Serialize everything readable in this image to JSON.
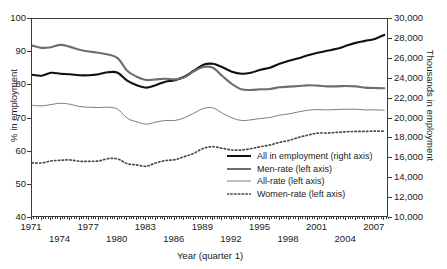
{
  "figure": {
    "caption": "",
    "axis_title_left": "% in employment",
    "axis_title_right": "Thousands in employment",
    "axis_title_x": "Year (quarter 1)"
  },
  "chart_data": {
    "type": "line",
    "title": "",
    "xlabel": "Year (quarter I)",
    "ylabel": "% in employment",
    "y2label": "Thousands in employment",
    "grid": false,
    "legend_position": "inside-bottom-right",
    "xlim": [
      1971,
      2008.5
    ],
    "ylim": [
      40,
      100
    ],
    "y2lim": [
      10000,
      30000
    ],
    "xticklabels": [
      "1971",
      "1974",
      "1977",
      "1980",
      "1983",
      "1986",
      "1989",
      "1992",
      "1995",
      "1998",
      "2001",
      "2004",
      "2007"
    ],
    "xtickvalues": [
      1971,
      1974,
      1977,
      1980,
      1983,
      1986,
      1989,
      1992,
      1995,
      1998,
      2001,
      2004,
      2007
    ],
    "yticklabels": [
      "40",
      "50",
      "60",
      "70",
      "80",
      "90",
      "100"
    ],
    "ytickvalues": [
      40,
      50,
      60,
      70,
      80,
      90,
      100
    ],
    "y2ticklabels": [
      "10,000",
      "12,000",
      "14,000",
      "16,000",
      "18,000",
      "20,000",
      "22,000",
      "24,000",
      "26,000",
      "28,000",
      "30,000"
    ],
    "y2tickvalues": [
      10000,
      12000,
      14000,
      16000,
      18000,
      20000,
      22000,
      24000,
      26000,
      28000,
      30000
    ],
    "x": [
      1971,
      1972,
      1973,
      1974,
      1975,
      1976,
      1977,
      1978,
      1979,
      1980,
      1981,
      1982,
      1983,
      1984,
      1985,
      1986,
      1987,
      1988,
      1989,
      1990,
      1991,
      1992,
      1993,
      1994,
      1995,
      1996,
      1997,
      1998,
      1999,
      2000,
      2001,
      2002,
      2003,
      2004,
      2005,
      2006,
      2007,
      2008
    ],
    "series": [
      {
        "name": "All in employment (right axis)",
        "axis": "right",
        "style": "solid-thick-black",
        "color": "#111111",
        "units": "thousands",
        "values": [
          24400,
          24300,
          24600,
          24500,
          24450,
          24350,
          24350,
          24450,
          24650,
          24600,
          23800,
          23350,
          23100,
          23350,
          23700,
          23850,
          24200,
          24800,
          25400,
          25500,
          25150,
          24700,
          24500,
          24600,
          24900,
          25100,
          25500,
          25800,
          26050,
          26350,
          26600,
          26800,
          27000,
          27300,
          27600,
          27800,
          28000,
          28400
        ]
      },
      {
        "name": "Men-rate (left axis)",
        "axis": "left",
        "style": "solid-thick-gray",
        "color": "#6e6e6e",
        "units": "percent",
        "values": [
          92.0,
          91.3,
          91.5,
          92.2,
          91.6,
          90.7,
          90.2,
          89.8,
          89.3,
          88.2,
          84.4,
          82.6,
          81.6,
          81.8,
          82.0,
          81.8,
          82.4,
          84.2,
          85.5,
          85.3,
          82.8,
          80.4,
          78.8,
          78.6,
          78.8,
          78.9,
          79.4,
          79.6,
          79.8,
          80.0,
          79.9,
          79.7,
          79.7,
          79.8,
          79.7,
          79.3,
          79.2,
          79.1
        ]
      },
      {
        "name": "All-rate (left axis)",
        "axis": "left",
        "style": "solid-thin-gray",
        "color": "#6e6e6e",
        "units": "percent",
        "values": [
          74.0,
          73.8,
          74.2,
          74.6,
          74.3,
          73.6,
          73.4,
          73.3,
          73.4,
          72.8,
          70.1,
          69.0,
          68.3,
          68.9,
          69.4,
          69.4,
          70.2,
          71.6,
          73.0,
          73.2,
          71.6,
          70.2,
          69.4,
          69.6,
          70.0,
          70.3,
          71.0,
          71.4,
          72.0,
          72.5,
          72.7,
          72.6,
          72.7,
          72.8,
          72.8,
          72.6,
          72.6,
          72.5
        ]
      },
      {
        "name": "Women-rate (left axis)",
        "axis": "left",
        "style": "dotted-gray",
        "color": "#4a4a4a",
        "units": "percent",
        "values": [
          56.6,
          56.6,
          57.2,
          57.4,
          57.5,
          57.1,
          57.1,
          57.2,
          57.9,
          57.8,
          56.4,
          56.0,
          55.6,
          56.6,
          57.3,
          57.6,
          58.5,
          59.5,
          61.0,
          61.5,
          61.0,
          60.5,
          60.5,
          60.9,
          61.5,
          62.0,
          62.8,
          63.4,
          64.3,
          65.0,
          65.6,
          65.6,
          65.8,
          66.0,
          66.1,
          66.1,
          66.2,
          66.2
        ]
      }
    ]
  },
  "legend": {
    "items": [
      {
        "label": "All in employment (right axis)",
        "key": "solid-thick-black"
      },
      {
        "label": "Men-rate (left axis)",
        "key": "solid-thick-gray"
      },
      {
        "label": "All-rate (left axis)",
        "key": "solid-thin-gray"
      },
      {
        "label": "Women-rate (left axis)",
        "key": "dotted-gray"
      }
    ]
  }
}
